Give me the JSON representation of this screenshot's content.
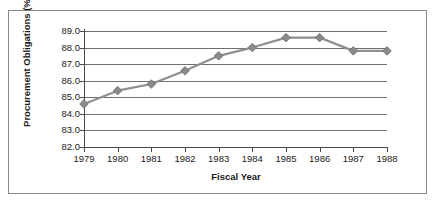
{
  "chart_data": {
    "type": "line",
    "title": "",
    "xlabel": "Fiscal Year",
    "ylabel": "Procurement Obligations (%)",
    "categories": [
      "1979",
      "1980",
      "1981",
      "1982",
      "1983",
      "1984",
      "1985",
      "1986",
      "1987",
      "1988"
    ],
    "x": [
      1979,
      1980,
      1981,
      1982,
      1983,
      1984,
      1985,
      1986,
      1987,
      1988
    ],
    "values": [
      84.6,
      85.4,
      85.8,
      86.6,
      87.5,
      88.0,
      88.6,
      88.6,
      87.8,
      87.8
    ],
    "series": [
      {
        "name": "Procurement Obligations",
        "values": [
          84.6,
          85.4,
          85.8,
          86.6,
          87.5,
          88.0,
          88.6,
          88.6,
          87.8,
          87.8
        ]
      }
    ],
    "ylim": [
      82.0,
      89.0
    ],
    "ytick_labels": [
      "89.0",
      "88.0",
      "87.0",
      "86.0",
      "85.0",
      "84.0",
      "83.0",
      "82.0"
    ],
    "ytick_values": [
      89.0,
      88.0,
      87.0,
      86.0,
      85.0,
      84.0,
      83.0,
      82.0
    ],
    "grid": true,
    "legend": false,
    "legend_position": "none",
    "marker": "diamond",
    "line_color": "#8f8f8f",
    "marker_color": "#8a8a8a",
    "grid_color": "#6f6f6f",
    "frame_color": "#8a8a8a",
    "background_color": "#ffffff",
    "text_color": "#1a1a1a"
  }
}
